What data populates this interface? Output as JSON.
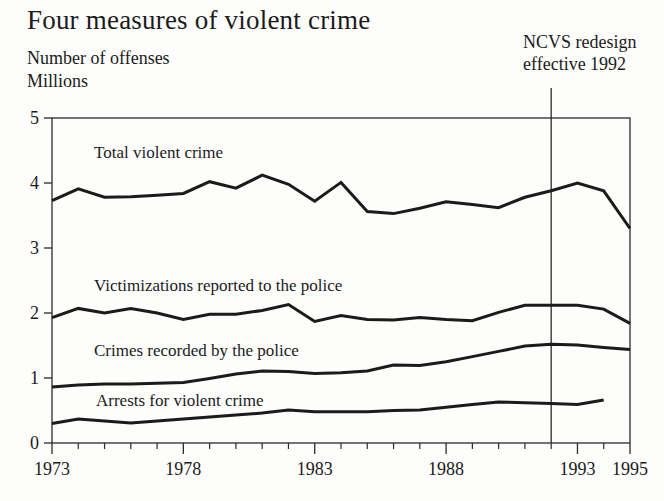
{
  "page": {
    "title": "Four measures of violent crime",
    "y_axis_label": {
      "line1": "Number of offenses",
      "line2": "Millions"
    },
    "annotation": {
      "line1": "NCVS redesign",
      "line2": "effective 1992"
    }
  },
  "colors": {
    "ink": "#1b1b1b",
    "frame": "#2b2b2b",
    "background": "#fdfdfb"
  },
  "chart_data": {
    "type": "line",
    "title": "Four measures of violent crime",
    "ylabel": "Number of offenses, Millions",
    "ylim": [
      0,
      5
    ],
    "xlim": [
      1973,
      1995
    ],
    "y_ticks": [
      0,
      1,
      2,
      3,
      4,
      5
    ],
    "x_labeled_ticks": [
      1973,
      1978,
      1983,
      1988,
      1993,
      1995
    ],
    "grid": false,
    "legend_position": "labels-inside-plot",
    "annotation_line_x": 1992,
    "annotation_text": "NCVS redesign effective 1992",
    "series": [
      {
        "name": "Total violent crime",
        "years": [
          1973,
          1974,
          1975,
          1976,
          1977,
          1978,
          1979,
          1980,
          1981,
          1982,
          1983,
          1984,
          1985,
          1986,
          1987,
          1988,
          1989,
          1990,
          1991,
          1992,
          1993,
          1994,
          1995
        ],
        "values": [
          3.73,
          3.91,
          3.78,
          3.79,
          3.81,
          3.84,
          4.02,
          3.92,
          4.12,
          3.98,
          3.72,
          4.01,
          3.56,
          3.53,
          3.61,
          3.71,
          3.67,
          3.62,
          3.78,
          3.88,
          4.0,
          3.88,
          3.3
        ]
      },
      {
        "name": "Victimizations reported to the police",
        "years": [
          1973,
          1974,
          1975,
          1976,
          1977,
          1978,
          1979,
          1980,
          1981,
          1982,
          1983,
          1984,
          1985,
          1986,
          1987,
          1988,
          1989,
          1990,
          1991,
          1992,
          1993,
          1994,
          1995
        ],
        "values": [
          1.93,
          2.07,
          2.0,
          2.07,
          2.0,
          1.9,
          1.98,
          1.98,
          2.04,
          2.13,
          1.87,
          1.96,
          1.9,
          1.89,
          1.93,
          1.9,
          1.88,
          2.01,
          2.12,
          2.12,
          2.12,
          2.06,
          1.84
        ]
      },
      {
        "name": "Crimes recorded by the police",
        "years": [
          1973,
          1974,
          1975,
          1976,
          1977,
          1978,
          1979,
          1980,
          1981,
          1982,
          1983,
          1984,
          1985,
          1986,
          1987,
          1988,
          1989,
          1990,
          1991,
          1992,
          1993,
          1994,
          1995
        ],
        "values": [
          0.86,
          0.89,
          0.91,
          0.91,
          0.92,
          0.93,
          0.99,
          1.06,
          1.11,
          1.1,
          1.07,
          1.08,
          1.11,
          1.2,
          1.19,
          1.25,
          1.33,
          1.41,
          1.49,
          1.52,
          1.51,
          1.47,
          1.44
        ]
      },
      {
        "name": "Arrests for violent crime",
        "years": [
          1973,
          1974,
          1975,
          1976,
          1977,
          1978,
          1979,
          1980,
          1981,
          1982,
          1983,
          1984,
          1985,
          1986,
          1987,
          1988,
          1989,
          1990,
          1991,
          1992,
          1993,
          1994
        ],
        "values": [
          0.3,
          0.37,
          0.34,
          0.31,
          0.34,
          0.37,
          0.4,
          0.43,
          0.46,
          0.51,
          0.48,
          0.48,
          0.48,
          0.5,
          0.51,
          0.55,
          0.59,
          0.63,
          0.62,
          0.61,
          0.59,
          0.66
        ]
      }
    ]
  }
}
